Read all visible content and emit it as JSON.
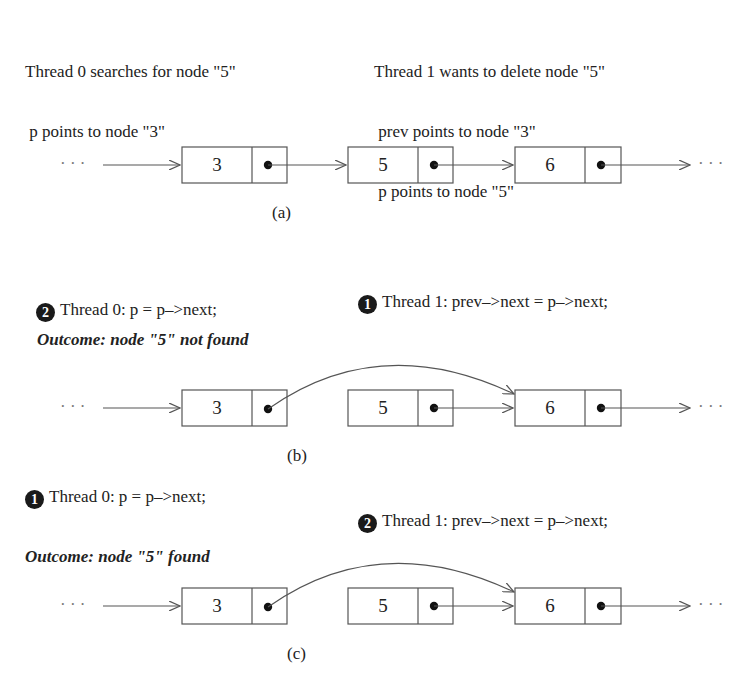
{
  "panel_a": {
    "thread0_lines": [
      "Thread 0 searches for node \"5\"",
      " p points to node \"3\""
    ],
    "thread1_lines": [
      "Thread 1 wants to delete node \"5\"",
      " prev points to node \"3\"",
      " p points to node \"5\""
    ],
    "nodes": [
      "3",
      "5",
      "6"
    ],
    "ellipsis": "· · ·",
    "caption": "(a)"
  },
  "panel_b": {
    "thread0": {
      "step": "2",
      "text": "Thread 0: p = p–>next;"
    },
    "thread1": {
      "step": "1",
      "text": "Thread 1: prev–>next = p–>next;"
    },
    "outcome": "Outcome: node \"5\" not found",
    "nodes": [
      "3",
      "5",
      "6"
    ],
    "ellipsis": "· · ·",
    "caption": "(b)"
  },
  "panel_c": {
    "thread0": {
      "step": "1",
      "text": "Thread 0: p = p–>next;"
    },
    "thread1": {
      "step": "2",
      "text": "Thread 1: prev–>next = p–>next;"
    },
    "outcome": "Outcome: node \"5\" found",
    "nodes": [
      "3",
      "5",
      "6"
    ],
    "ellipsis": "· · ·",
    "caption": "(c)"
  },
  "colors": {
    "ink": "#222222",
    "line": "#555555",
    "badge": "#1a1a1a"
  }
}
